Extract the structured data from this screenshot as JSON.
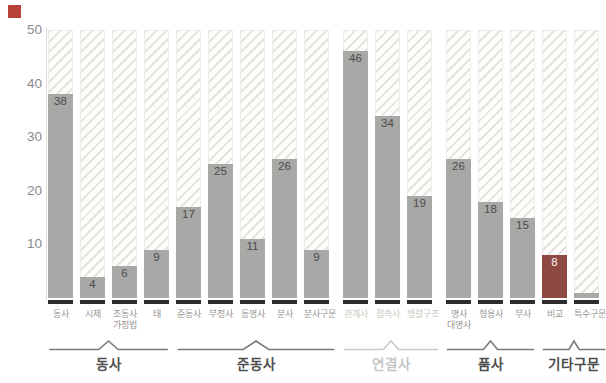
{
  "chart_data": {
    "type": "bar",
    "title": "",
    "ylabel": "",
    "xlabel": "",
    "ylim": [
      0,
      50
    ],
    "yticks": [
      10,
      20,
      30,
      40,
      50
    ],
    "grid": false,
    "legend": "none",
    "groups": [
      {
        "label": "동사",
        "muted": false,
        "bars": [
          {
            "label": "동사",
            "value": 38
          },
          {
            "label": "시제",
            "value": 4
          },
          {
            "label": "조동사\n가정법",
            "value": 6
          },
          {
            "label": "태",
            "value": 9
          }
        ]
      },
      {
        "label": "준동사",
        "muted": false,
        "bars": [
          {
            "label": "준동사",
            "value": 17
          },
          {
            "label": "부정사",
            "value": 25
          },
          {
            "label": "동명사",
            "value": 11
          },
          {
            "label": "분사",
            "value": 26
          },
          {
            "label": "분사구문",
            "value": 9
          }
        ]
      },
      {
        "label": "연결사",
        "muted": true,
        "bars": [
          {
            "label": "관계사",
            "value": 46
          },
          {
            "label": "접속사",
            "value": 34
          },
          {
            "label": "병렬구조",
            "value": 19
          }
        ]
      },
      {
        "label": "품사",
        "muted": false,
        "bars": [
          {
            "label": "명사\n대명사",
            "value": 26
          },
          {
            "label": "형용사",
            "value": 18
          },
          {
            "label": "부사",
            "value": 15
          }
        ]
      },
      {
        "label": "기타구문",
        "muted": false,
        "bars": [
          {
            "label": "비교",
            "value": 8,
            "dark": true
          },
          {
            "label": "특수구문",
            "value": 1,
            "show_value": false
          }
        ]
      }
    ]
  },
  "palette": {
    "bar": "#a8a8a6",
    "bar_dark": "#8e4a42",
    "hatch_line": "#e7e3de",
    "hatch_bg": "#fdfdfc",
    "value_text": "#4c4c4c",
    "value_text_on_dark": "#f5f3f2",
    "tick_text": "#9a9792",
    "tick_text_muted": "#cdc6ba",
    "brace": "#7a7a7a",
    "brace_muted": "#c9c9c9",
    "group_text": "#4e4e4e",
    "group_text_muted": "#c6c6c6",
    "axis_text": "#8a8a8a",
    "baseline_edge": "#6f6f6f",
    "baseline_seg": "#2d2d2d",
    "marker_red": "#b6423a"
  }
}
